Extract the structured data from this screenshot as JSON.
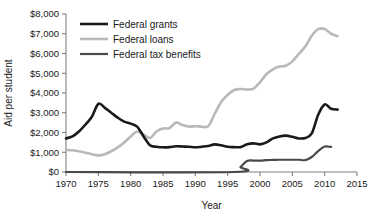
{
  "chart_data": {
    "type": "line",
    "title": "",
    "xlabel": "Year",
    "ylabel": "Aid per student",
    "xlim": [
      1970,
      2015
    ],
    "ylim": [
      0,
      8000
    ],
    "grid": false,
    "legend_position": "top-left",
    "xticks": [
      "1970",
      "1975",
      "1980",
      "1985",
      "1990",
      "1995",
      "2000",
      "2005",
      "2010",
      "2015"
    ],
    "xtick_values": [
      1970,
      1975,
      1980,
      1985,
      1990,
      1995,
      2000,
      2005,
      2010,
      2015
    ],
    "yticks": [
      "$0",
      "$1,000",
      "$2,000",
      "$3,000",
      "$4,000",
      "$5,000",
      "$6,000",
      "$7,000",
      "$8,000"
    ],
    "ytick_values": [
      0,
      1000,
      2000,
      3000,
      4000,
      5000,
      6000,
      7000,
      8000
    ],
    "series": [
      {
        "name": "Federal grants",
        "color": "#1a1a1a",
        "width": 2.6,
        "x": [
          1970,
          1971,
          1972,
          1973,
          1974,
          1975,
          1976,
          1977,
          1978,
          1979,
          1980,
          1981,
          1982,
          1983,
          1984,
          1985,
          1986,
          1987,
          1988,
          1989,
          1990,
          1991,
          1992,
          1993,
          1994,
          1995,
          1996,
          1997,
          1998,
          1999,
          2000,
          2001,
          2002,
          2003,
          2004,
          2005,
          2006,
          2007,
          2008,
          2009,
          2010,
          2011,
          2012
        ],
        "values": [
          1700,
          1800,
          2050,
          2400,
          2800,
          3450,
          3250,
          3000,
          2750,
          2550,
          2450,
          2300,
          1800,
          1350,
          1280,
          1250,
          1260,
          1300,
          1290,
          1280,
          1250,
          1280,
          1320,
          1400,
          1350,
          1280,
          1260,
          1260,
          1400,
          1450,
          1400,
          1500,
          1700,
          1800,
          1840,
          1780,
          1700,
          1720,
          1950,
          2900,
          3420,
          3200,
          3160
        ]
      },
      {
        "name": "Federal loans",
        "color": "#b9b9b9",
        "width": 2.6,
        "x": [
          1970,
          1971,
          1972,
          1973,
          1974,
          1975,
          1976,
          1977,
          1978,
          1979,
          1980,
          1981,
          1982,
          1983,
          1984,
          1985,
          1986,
          1987,
          1988,
          1989,
          1990,
          1991,
          1992,
          1993,
          1994,
          1995,
          1996,
          1997,
          1998,
          1999,
          2000,
          2001,
          2002,
          2003,
          2004,
          2005,
          2006,
          2007,
          2008,
          2009,
          2010,
          2011,
          2012
        ],
        "values": [
          1120,
          1100,
          1050,
          980,
          900,
          840,
          900,
          1050,
          1250,
          1500,
          1800,
          2050,
          1900,
          1720,
          2050,
          2200,
          2220,
          2500,
          2380,
          2300,
          2320,
          2300,
          2320,
          2950,
          3550,
          3900,
          4150,
          4200,
          4180,
          4220,
          4550,
          4950,
          5200,
          5340,
          5380,
          5600,
          5980,
          6350,
          6900,
          7230,
          7240,
          7000,
          6880
        ]
      },
      {
        "name": "Federal tax benefits",
        "color": "#4a4a4a",
        "width": 2.2,
        "x": [
          1970,
          1996,
          1997,
          1998,
          1999,
          2000,
          2001,
          2002,
          2003,
          2004,
          2005,
          2006,
          2007,
          2008,
          2009,
          2010,
          2011
        ],
        "values": [
          0,
          0,
          260,
          560,
          580,
          580,
          600,
          610,
          620,
          620,
          620,
          620,
          600,
          760,
          1060,
          1290,
          1270
        ]
      }
    ]
  },
  "legend": {
    "items": [
      {
        "label": "Federal grants",
        "color": "#1a1a1a"
      },
      {
        "label": "Federal loans",
        "color": "#b9b9b9"
      },
      {
        "label": "Federal tax benefits",
        "color": "#4a4a4a"
      }
    ]
  },
  "axes": {
    "y_title": "Aid per student",
    "x_title": "Year"
  }
}
